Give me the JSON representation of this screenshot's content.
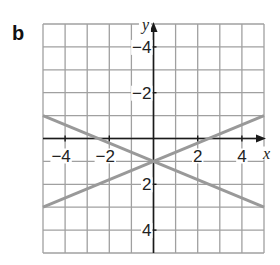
{
  "figure": {
    "label": "b",
    "x_axis_label": "x",
    "y_axis_label": "y",
    "x_tick_labels": [
      "−4",
      "−2",
      "2",
      "4"
    ],
    "y_tick_labels": [
      "4",
      "2",
      "−2",
      "−4"
    ]
  },
  "chart_data": {
    "type": "line",
    "title": "",
    "xlabel": "x",
    "ylabel": "y",
    "xlim": [
      -5,
      5
    ],
    "ylim": [
      -5,
      5
    ],
    "grid": true,
    "x_ticks": [
      -4,
      -2,
      2,
      4
    ],
    "y_ticks": [
      -4,
      -2,
      2,
      4
    ],
    "series": [
      {
        "name": "line 1",
        "equation": "y = -0.4x - 1",
        "x": [
          -5,
          5
        ],
        "y": [
          1,
          -3
        ]
      },
      {
        "name": "line 2",
        "equation": "y = 0.4x - 1",
        "x": [
          -5,
          5
        ],
        "y": [
          -3,
          1
        ]
      }
    ],
    "intersection": [
      0,
      -1
    ],
    "line_color": "#999999",
    "grid_color": "#a0a0a0"
  }
}
